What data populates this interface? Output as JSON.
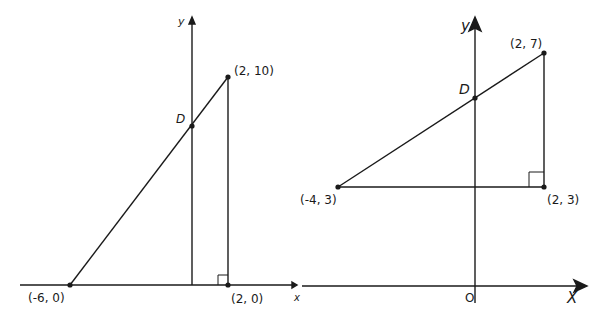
{
  "figures": [
    {
      "id": "left",
      "axes": {
        "x_label": "x",
        "y_label": "y"
      },
      "points": [
        {
          "name": "A",
          "label": "(-6, 0)",
          "x": -6,
          "y": 0
        },
        {
          "name": "B",
          "label": "(2, 10)",
          "x": 2,
          "y": 10
        },
        {
          "name": "C",
          "label": "(2, 0)",
          "x": 2,
          "y": 0
        },
        {
          "name": "D",
          "label": "D",
          "x": 0,
          "y": 2.5
        }
      ],
      "segments": [
        "(-6,0)-(2,10)",
        "(2,10)-(2,0)",
        "y-axis from D to origin"
      ],
      "right_angle_at": "(2, 0)"
    },
    {
      "id": "right",
      "axes": {
        "x_label": "X",
        "y_label": "y",
        "origin_label": "O"
      },
      "points": [
        {
          "name": "A",
          "label": "(-4, 3)",
          "x": -4,
          "y": 3
        },
        {
          "name": "B",
          "label": "(2, 7)",
          "x": 2,
          "y": 7
        },
        {
          "name": "C",
          "label": "(2, 3)",
          "x": 2,
          "y": 3
        },
        {
          "name": "D",
          "label": "D",
          "x": 0,
          "y": 5.67
        }
      ],
      "segments": [
        "(-4,3)-(2,7)",
        "(2,7)-(2,3)",
        "(-4,3)-(2,3)"
      ],
      "right_angle_at": "(2, 3)"
    }
  ],
  "labels": {
    "left_y": "y",
    "left_x": "x",
    "left_b": "(2, 10)",
    "left_d": "D",
    "left_a": "(-6, 0)",
    "left_c": "(2, 0)",
    "right_y": "y",
    "right_x": "X",
    "right_o": "O",
    "right_b": "(2, 7)",
    "right_d": "D",
    "right_a": "(-4, 3)",
    "right_c": "(2, 3)"
  },
  "colors": {
    "stroke": "#1a1a1a",
    "background": "#ffffff"
  }
}
